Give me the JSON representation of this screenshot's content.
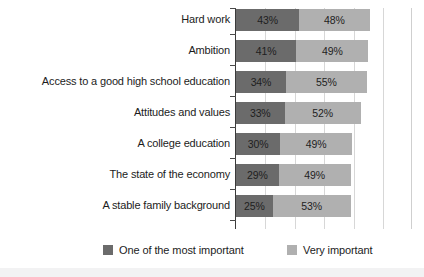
{
  "chart_data": {
    "type": "bar",
    "subtype": "stacked-horizontal",
    "title": "",
    "xlabel": "",
    "ylabel": "",
    "xlim": [
      0,
      120
    ],
    "grid": true,
    "grid_axis": "x",
    "legend_position": "bottom",
    "categories": [
      "Hard work",
      "Ambition",
      "Access to a good high school education",
      "Attitudes and values",
      "A college education",
      "The state of the economy",
      "A stable family background"
    ],
    "series": [
      {
        "name": "One of the most important",
        "color": "#6b6b6b",
        "values": [
          43,
          41,
          34,
          33,
          30,
          29,
          25
        ],
        "labels": [
          "43%",
          "41%",
          "34%",
          "33%",
          "30%",
          "29%",
          "25%"
        ]
      },
      {
        "name": "Very important",
        "color": "#b0b0b0",
        "values": [
          48,
          49,
          55,
          52,
          49,
          49,
          53
        ],
        "labels": [
          "48%",
          "49%",
          "55%",
          "52%",
          "49%",
          "49%",
          "53%"
        ]
      }
    ],
    "totals": [
      91,
      90,
      89,
      85,
      79,
      78,
      78
    ],
    "gridline_values": [
      0,
      20,
      40,
      60,
      80,
      100
    ]
  },
  "legend": {
    "items": [
      {
        "label": "One of the most important",
        "color": "#6b6b6b"
      },
      {
        "label": "Very important",
        "color": "#b0b0b0"
      }
    ]
  },
  "colors": {
    "dark": "#6b6b6b",
    "light": "#b0b0b0",
    "axis": "#3b3b3b",
    "gridline": "#d7d7d7",
    "text": "#1c1c1c",
    "background": "#ffffff",
    "page": "#f2f2f3"
  }
}
